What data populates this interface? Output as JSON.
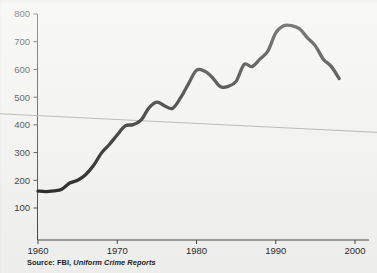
{
  "source": {
    "prefix": "Source: FBI,",
    "title": "Uniform Crime Reports"
  },
  "chart_data": {
    "type": "line",
    "title": "",
    "subtitle": "",
    "xlabel": "",
    "ylabel": "",
    "xlim": [
      1960,
      2002
    ],
    "ylim": [
      0,
      820
    ],
    "xticks": [
      1960,
      1970,
      1980,
      1990,
      2000
    ],
    "xticklabels": [
      "1960",
      "1970",
      "1980",
      "1990",
      "2000"
    ],
    "yticks": [
      100,
      200,
      300,
      400,
      500,
      600,
      700,
      800
    ],
    "yticklabels": [
      "100",
      "200",
      "300",
      "400",
      "500",
      "600",
      "700",
      "800"
    ],
    "grid": false,
    "legend": "none",
    "series": [
      {
        "name": "Violent crime rate per 100,000",
        "color": "#0b0b0b",
        "x": [
          1960,
          1961,
          1962,
          1963,
          1964,
          1965,
          1966,
          1967,
          1968,
          1969,
          1970,
          1971,
          1972,
          1973,
          1974,
          1975,
          1976,
          1977,
          1978,
          1979,
          1980,
          1981,
          1982,
          1983,
          1984,
          1985,
          1986,
          1987,
          1988,
          1989,
          1990,
          1991,
          1992,
          1993,
          1994,
          1995,
          1996,
          1997,
          1998
        ],
        "values": [
          161,
          159,
          162,
          168,
          190,
          200,
          220,
          253,
          298,
          329,
          364,
          396,
          401,
          417,
          461,
          482,
          468,
          460,
          498,
          549,
          597,
          594,
          571,
          538,
          539,
          557,
          618,
          610,
          637,
          666,
          732,
          758,
          758,
          747,
          714,
          685,
          637,
          611,
          567
        ]
      },
      {
        "name": "Linear trend",
        "color": "#9a9a9a",
        "x": [
          1960,
          2002
        ],
        "values": [
          440,
          373
        ]
      }
    ]
  }
}
